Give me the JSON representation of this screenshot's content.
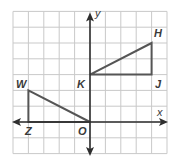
{
  "diagram": {
    "type": "coordinate-grid",
    "grid": {
      "x_range": [
        -5,
        5
      ],
      "y_range": [
        -2,
        7
      ],
      "color": "#c9c9c9"
    },
    "axes": {
      "x_label": "x",
      "y_label": "y",
      "color": "#2e2e2e"
    },
    "shape_color": "#555555",
    "triangles": [
      {
        "name": "triangle-HJK",
        "vertices": [
          {
            "label": "H",
            "x": 4,
            "y": 5
          },
          {
            "label": "J",
            "x": 4,
            "y": 3
          },
          {
            "label": "K",
            "x": 0,
            "y": 3
          }
        ]
      },
      {
        "name": "triangle-WZO",
        "vertices": [
          {
            "label": "W",
            "x": -4,
            "y": 2
          },
          {
            "label": "Z",
            "x": -4,
            "y": 0
          },
          {
            "label": "O",
            "x": 0,
            "y": 0
          }
        ]
      }
    ],
    "labels": {
      "H": "H",
      "J": "J",
      "K": "K",
      "W": "W",
      "Z": "Z",
      "O": "O"
    }
  }
}
